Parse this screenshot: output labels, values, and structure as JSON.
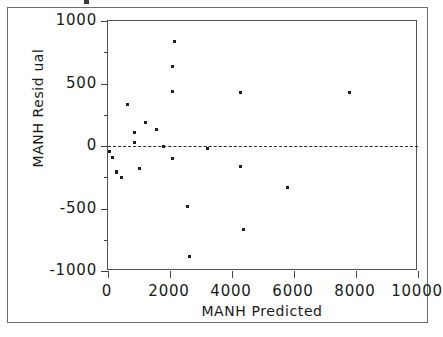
{
  "chart_data": {
    "type": "scatter",
    "title": "",
    "xlabel": "MANH Predicted",
    "ylabel": "MANH Resid ual",
    "xlim": [
      0,
      10000
    ],
    "ylim": [
      -1000,
      1000
    ],
    "grid": false,
    "legend": "none",
    "xticks": [
      0,
      2000,
      4000,
      6000,
      8000,
      10000
    ],
    "xtick_labels": [
      "0",
      "2000",
      "4000",
      "6000",
      "8000",
      "10000"
    ],
    "yticks": [
      -1000,
      -500,
      0,
      500,
      1000
    ],
    "ytick_labels": [
      "-1000",
      "-500",
      "0",
      "500",
      "1000"
    ],
    "yticks_minor": [
      -750,
      -250,
      250,
      750
    ],
    "reference_line": {
      "type": "horizontal-dashed",
      "y": 0,
      "style": "dashed",
      "color": "#2a2a2a"
    },
    "marker": {
      "shape": "square",
      "size_px": 3,
      "color": "#1f1f1f"
    },
    "points": [
      {
        "x": 35,
        "y": -45
      },
      {
        "x": 160,
        "y": -95
      },
      {
        "x": 260,
        "y": -200
      },
      {
        "x": 290,
        "y": -215
      },
      {
        "x": 420,
        "y": -255
      },
      {
        "x": 645,
        "y": 335
      },
      {
        "x": 840,
        "y": 110
      },
      {
        "x": 870,
        "y": 30
      },
      {
        "x": 1000,
        "y": -180
      },
      {
        "x": 1195,
        "y": 190
      },
      {
        "x": 1580,
        "y": 130
      },
      {
        "x": 1775,
        "y": 0
      },
      {
        "x": 2065,
        "y": 640
      },
      {
        "x": 2065,
        "y": 435
      },
      {
        "x": 2065,
        "y": -100
      },
      {
        "x": 2130,
        "y": 840
      },
      {
        "x": 2580,
        "y": -480
      },
      {
        "x": 2645,
        "y": -880
      },
      {
        "x": 3225,
        "y": -20
      },
      {
        "x": 4290,
        "y": 430
      },
      {
        "x": 4290,
        "y": -165
      },
      {
        "x": 4355,
        "y": -670
      },
      {
        "x": 5775,
        "y": -330
      },
      {
        "x": 7775,
        "y": 430
      }
    ]
  },
  "figure": {
    "xaxis_title": "MANH Predicted",
    "yaxis_title": "MANH Resid ual"
  }
}
